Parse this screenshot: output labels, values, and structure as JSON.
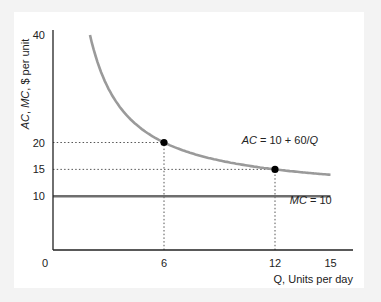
{
  "chart_data": {
    "type": "line",
    "title": "",
    "xlabel": "Q, Units per day",
    "ylabel_parts": [
      {
        "text": "AC",
        "italic": true
      },
      {
        "text": ", ",
        "italic": false
      },
      {
        "text": "MC",
        "italic": true
      },
      {
        "text": ", $ per unit",
        "italic": false
      }
    ],
    "ylabel": "AC, MC, $ per unit",
    "xlim": [
      0,
      16.2
    ],
    "ylim": [
      0,
      40
    ],
    "x_ticks": [
      {
        "value": 0,
        "label": "0"
      },
      {
        "value": 6,
        "label": "6"
      },
      {
        "value": 12,
        "label": "12"
      },
      {
        "value": 15,
        "label": "15"
      }
    ],
    "y_ticks": [
      {
        "value": 10,
        "label": "10"
      },
      {
        "value": 15,
        "label": "15"
      },
      {
        "value": 20,
        "label": "20"
      },
      {
        "value": 40,
        "label": "40"
      }
    ],
    "grid": false,
    "series": [
      {
        "name": "AC",
        "formula": "AC = 10 + 60/Q",
        "label_parts": [
          {
            "text": "AC",
            "italic": true
          },
          {
            "text": " = 10 + 60/",
            "italic": false
          },
          {
            "text": "Q",
            "italic": true
          }
        ],
        "x_range": [
          2,
          15
        ],
        "points": [
          [
            2,
            40
          ],
          [
            3,
            30
          ],
          [
            4,
            25
          ],
          [
            5,
            22
          ],
          [
            6,
            20
          ],
          [
            8,
            17.5
          ],
          [
            10,
            16
          ],
          [
            12,
            15
          ],
          [
            15,
            14
          ]
        ],
        "color": "#9a9a9a",
        "label_at": [
          10.2,
          19.8
        ]
      },
      {
        "name": "MC",
        "formula": "MC = 10",
        "label_parts": [
          {
            "text": "MC",
            "italic": true
          },
          {
            "text": " = 10",
            "italic": false
          }
        ],
        "x_range": [
          0,
          15
        ],
        "points": [
          [
            0,
            10
          ],
          [
            15,
            10
          ]
        ],
        "color": "#6e6e6e",
        "label_at": [
          12.8,
          8.5
        ]
      }
    ],
    "highlight_points": [
      {
        "x": 6,
        "y": 20
      },
      {
        "x": 12,
        "y": 15
      }
    ],
    "reference_lines": [
      {
        "from": [
          0,
          20
        ],
        "to": [
          6,
          20
        ]
      },
      {
        "from": [
          6,
          0
        ],
        "to": [
          6,
          20
        ]
      },
      {
        "from": [
          0,
          15
        ],
        "to": [
          12,
          15
        ]
      },
      {
        "from": [
          12,
          0
        ],
        "to": [
          12,
          15
        ]
      }
    ]
  }
}
